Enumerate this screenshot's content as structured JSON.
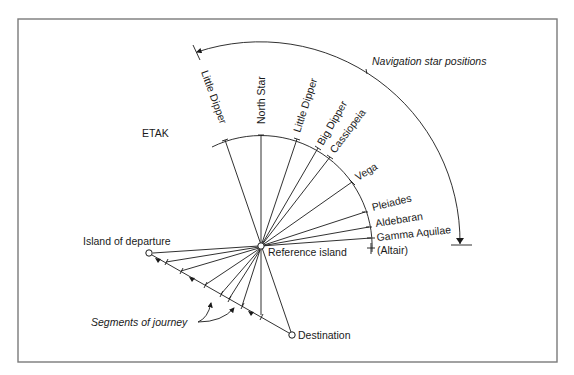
{
  "diagram": {
    "title_label": "ETAK",
    "outer_arc_label": "Navigation star positions",
    "reference_label": "Reference island",
    "departure_label": "Island of departure",
    "destination_label": "Destination",
    "segments_label": "Segments of journey",
    "stars": [
      {
        "name": "Little Dipper",
        "tick": [
          225,
          140
        ]
      },
      {
        "name": "North Star",
        "tick": [
          261,
          135
        ]
      },
      {
        "name": "Little Dipper",
        "tick": [
          297,
          139
        ]
      },
      {
        "name": "Big Dipper",
        "tick": [
          318,
          148
        ]
      },
      {
        "name": "Cassiopeia",
        "tick": [
          330,
          157
        ]
      },
      {
        "name": "Vega",
        "tick": [
          352,
          182
        ]
      },
      {
        "name": "Pleiades",
        "tick": [
          365,
          212
        ]
      },
      {
        "name": "Aldebaran",
        "tick": [
          369,
          227
        ]
      },
      {
        "name": "Gamma Aquilae",
        "tick": [
          371,
          238
        ]
      }
    ],
    "star_extra_label": "(Altair)",
    "reference_point": [
      261,
      246
    ],
    "departure_point": [
      149,
      253
    ],
    "destination_point": [
      292,
      335
    ],
    "colors": {
      "ink": "#1a1a1a",
      "frame": "#7a7a7a",
      "background": "#ffffff"
    }
  }
}
